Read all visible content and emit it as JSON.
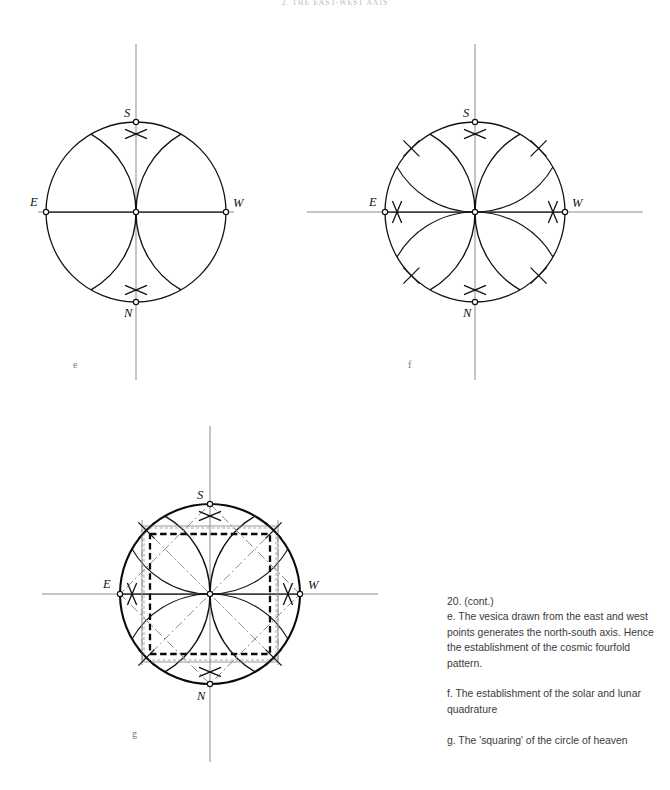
{
  "page": {
    "running_head": "2. THE EAST-WEST AXIS",
    "width": 670,
    "height": 790,
    "background": "#ffffff",
    "ink_color": "#111111",
    "muted_ink_color": "#8b8b8b"
  },
  "figures": [
    {
      "id": "e",
      "panel_letter": "e",
      "panel_letter_pos": {
        "x": 73,
        "y": 368
      },
      "description": "Vesica drawn from east and west points generating the north-south axis",
      "center": {
        "x": 136,
        "y": 212
      },
      "radius": 90,
      "inner_circle_radius": 90,
      "vesica_axis": "horizontal",
      "cusp_top": {
        "x": 136,
        "y": 47
      },
      "cusp_bottom": {
        "x": 136,
        "y": 377
      },
      "points": [
        {
          "name": "S",
          "x": 136,
          "y": 122,
          "label_dx": -12,
          "label_dy": -5
        },
        {
          "name": "N",
          "x": 136,
          "y": 302,
          "label_dx": -12,
          "label_dy": 15
        },
        {
          "name": "E",
          "x": 46,
          "y": 212,
          "label_dx": -16,
          "label_dy": -6
        },
        {
          "name": "W",
          "x": 226,
          "y": 212,
          "label_dx": 7,
          "label_dy": -5
        }
      ],
      "has_outer_petals": false,
      "has_squares": false
    },
    {
      "id": "f",
      "panel_letter": "f",
      "panel_letter_pos": {
        "x": 408,
        "y": 368
      },
      "description": "The establishment of the solar and lunar quadrature",
      "center": {
        "x": 475,
        "y": 212
      },
      "radius": 90,
      "inner_circle_radius": 90,
      "vesica_axis": "both",
      "cusp_top": {
        "x": 475,
        "y": 47
      },
      "cusp_bottom": {
        "x": 475,
        "y": 377
      },
      "cusp_left": {
        "x": 310,
        "y": 212
      },
      "cusp_right": {
        "x": 640,
        "y": 212
      },
      "points": [
        {
          "name": "S",
          "x": 475,
          "y": 122,
          "label_dx": -12,
          "label_dy": -5
        },
        {
          "name": "N",
          "x": 475,
          "y": 302,
          "label_dx": -12,
          "label_dy": 15
        },
        {
          "name": "E",
          "x": 385,
          "y": 212,
          "label_dx": -16,
          "label_dy": -6
        },
        {
          "name": "W",
          "x": 565,
          "y": 212,
          "label_dx": 7,
          "label_dy": -5
        }
      ],
      "has_outer_petals": true,
      "has_squares": false
    },
    {
      "id": "g",
      "panel_letter": "g",
      "panel_letter_pos": {
        "x": 132,
        "y": 737
      },
      "description": "The squaring of the circle of heaven",
      "center": {
        "x": 210,
        "y": 594
      },
      "radius": 90,
      "inner_circle_radius": 90,
      "vesica_axis": "both",
      "cusp_top": {
        "x": 210,
        "y": 429
      },
      "cusp_bottom": {
        "x": 210,
        "y": 759
      },
      "cusp_left": {
        "x": 56,
        "y": 594
      },
      "cusp_right": {
        "x": 364,
        "y": 594
      },
      "points": [
        {
          "name": "S",
          "x": 210,
          "y": 504,
          "label_dx": -13,
          "label_dy": -5
        },
        {
          "name": "N",
          "x": 210,
          "y": 684,
          "label_dx": -13,
          "label_dy": 16
        },
        {
          "name": "E",
          "x": 120,
          "y": 594,
          "label_dx": -17,
          "label_dy": -6
        },
        {
          "name": "W",
          "x": 300,
          "y": 594,
          "label_dx": 8,
          "label_dy": -5
        }
      ],
      "has_outer_petals": true,
      "has_squares": true,
      "squares": [
        {
          "name": "outer-faint-square",
          "half_side": 66,
          "style": "faint-dashed"
        },
        {
          "name": "inscribed-bold-square",
          "half_side": 60,
          "style": "bold-dashed"
        },
        {
          "name": "rotated-diamond",
          "half_diagonal": 90,
          "style": "dash-dot-rotated"
        }
      ]
    }
  ],
  "caption": {
    "number": "20. (cont.)",
    "paragraphs": [
      "e. The vesica drawn from the east and west points generates the north-south axis. Hence the establishment of the cosmic fourfold pattern.",
      "f. The establishment of the solar and lunar quadrature",
      "g. The 'squaring' of the circle of heaven"
    ]
  }
}
